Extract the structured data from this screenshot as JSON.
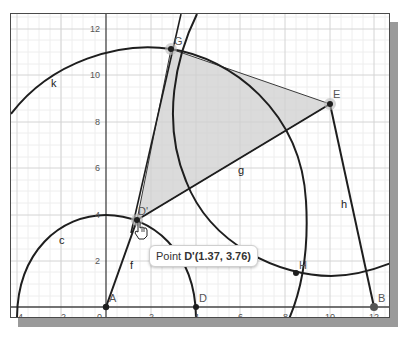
{
  "graphics_view": {
    "x_axis": {
      "ticks": [
        "-4",
        "-2",
        "0",
        "2",
        "4",
        "6",
        "8",
        "10",
        "12"
      ]
    },
    "y_axis": {
      "ticks": [
        "2",
        "4",
        "6",
        "8",
        "10",
        "12"
      ]
    },
    "points": [
      {
        "name": "A",
        "x": 0,
        "y": 0
      },
      {
        "name": "B",
        "x": 12,
        "y": 0
      },
      {
        "name": "D",
        "x": 4,
        "y": 0
      },
      {
        "name": "D'",
        "x": 1.37,
        "y": 3.76
      },
      {
        "name": "E",
        "x": 10,
        "y": 8.8
      },
      {
        "name": "G",
        "x": 3,
        "y": 11.2
      },
      {
        "name": "H",
        "x": 8.5,
        "y": 1.5
      }
    ],
    "labels": {
      "A": "A",
      "B": "B",
      "D": "D",
      "D_prime": "D'",
      "E": "E",
      "G": "G",
      "H": "H",
      "c": "c",
      "f": "f",
      "g": "g",
      "h": "h",
      "k": "k"
    },
    "tooltip": {
      "prefix": "Point ",
      "name": "D'",
      "coords": "(1.37, 3.76)"
    },
    "colors": {
      "polygon_fill": "#cfcfcf",
      "curve": "#1e1e1e",
      "grid_major": "#d6d6d6",
      "grid_minor": "#eeeeee",
      "axis": "#444444"
    }
  }
}
